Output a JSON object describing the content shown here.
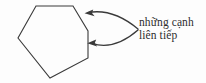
{
  "figure": {
    "type": "geometry-diagram",
    "background_color": "#fdfdfd",
    "stroke_color": "#3a3a3a",
    "text_color": "#2e2e2e",
    "shape": {
      "name": "hexagon",
      "sides": 6,
      "fill": "none",
      "stroke_width": 1.1,
      "vertices": [
        [
          36,
          6
        ],
        [
          73,
          6
        ],
        [
          88,
          31
        ],
        [
          88,
          58
        ],
        [
          50,
          78
        ],
        [
          18,
          38
        ]
      ]
    },
    "label": {
      "line1": "những cạnh",
      "line2": "liên tiếp",
      "full_text": "những cạnh liên tiếp"
    },
    "arrows": [
      {
        "id": "arrow-upper",
        "points_to": "upper-right-side",
        "start": [
          138,
          29
        ],
        "control": [
          110,
          12
        ],
        "end": [
          86,
          13
        ],
        "head_direction": "left"
      },
      {
        "id": "arrow-lower",
        "points_to": "lower-right-side",
        "start": [
          138,
          30
        ],
        "control": [
          112,
          48
        ],
        "end": [
          89,
          43
        ],
        "head_direction": "left"
      }
    ]
  }
}
